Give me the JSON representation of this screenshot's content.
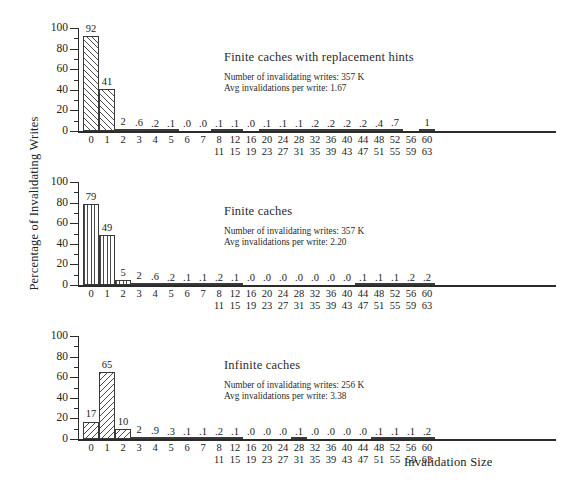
{
  "axis": {
    "y_title": "Percentage of Invalidating Writes",
    "x_title": "Invalidation Size",
    "y_ticks": [
      "0",
      "20",
      "40",
      "60",
      "80",
      "100"
    ],
    "x_tick_labels": [
      {
        "t1": "0",
        "t2": ""
      },
      {
        "t1": "1",
        "t2": ""
      },
      {
        "t1": "2",
        "t2": ""
      },
      {
        "t1": "3",
        "t2": ""
      },
      {
        "t1": "4",
        "t2": ""
      },
      {
        "t1": "5",
        "t2": ""
      },
      {
        "t1": "6",
        "t2": ""
      },
      {
        "t1": "7",
        "t2": ""
      },
      {
        "t1": "8",
        "t2": "11"
      },
      {
        "t1": "12",
        "t2": "15"
      },
      {
        "t1": "16",
        "t2": "19"
      },
      {
        "t1": "20",
        "t2": "23"
      },
      {
        "t1": "24",
        "t2": "27"
      },
      {
        "t1": "28",
        "t2": "31"
      },
      {
        "t1": "32",
        "t2": "35"
      },
      {
        "t1": "36",
        "t2": "39"
      },
      {
        "t1": "40",
        "t2": "43"
      },
      {
        "t1": "44",
        "t2": "47"
      },
      {
        "t1": "48",
        "t2": "51"
      },
      {
        "t1": "52",
        "t2": "55"
      },
      {
        "t1": "56",
        "t2": "59"
      },
      {
        "t1": "60",
        "t2": "63"
      }
    ]
  },
  "panels": [
    {
      "title": "Finite caches with replacement hints",
      "stat_writes": "Number of invalidating writes: 357 K",
      "stat_avg": "Avg invalidations per write: 1.67",
      "hatch": "hatch-a",
      "labels": [
        "92",
        "41",
        "2",
        ".6",
        ".2",
        ".1",
        ".0",
        ".0",
        ".1",
        ".1",
        ".0",
        ".1",
        ".1",
        ".1",
        ".2",
        ".2",
        ".2",
        ".2",
        ".4",
        ".7",
        "",
        "1"
      ],
      "values": [
        92,
        41,
        2,
        0.6,
        0.2,
        0.1,
        0.0,
        0.0,
        0.1,
        0.1,
        0.0,
        0.1,
        0.1,
        0.1,
        0.2,
        0.2,
        0.2,
        0.2,
        0.4,
        0.7,
        0,
        1
      ]
    },
    {
      "title": "Finite caches",
      "stat_writes": "Number of invalidating writes: 357 K",
      "stat_avg": "Avg invalidations per write: 2.20",
      "hatch": "hatch-b",
      "labels": [
        "79",
        "49",
        "5",
        "2",
        ".6",
        ".2",
        ".1",
        ".1",
        ".2",
        ".1",
        ".0",
        ".0",
        ".0",
        ".0",
        ".0",
        ".0",
        ".0",
        ".1",
        ".1",
        ".1",
        ".2",
        ".2",
        "3"
      ],
      "values": [
        79,
        49,
        5,
        2,
        0.6,
        0.2,
        0.1,
        0.1,
        0.2,
        0.1,
        0.0,
        0.0,
        0.0,
        0.0,
        0.0,
        0.0,
        0.0,
        0.1,
        0.1,
        0.1,
        0.2,
        0.2,
        3
      ]
    },
    {
      "title": "Infinite caches",
      "stat_writes": "Number of invalidating writes: 256 K",
      "stat_avg": "Avg invalidations per write: 3.38",
      "hatch": "hatch-c",
      "labels": [
        "17",
        "65",
        "10",
        "2",
        ".9",
        ".3",
        ".1",
        ".1",
        ".2",
        ".1",
        ".0",
        ".0",
        ".0",
        ".1",
        ".0",
        ".0",
        ".0",
        ".0",
        ".1",
        ".1",
        ".1",
        ".2",
        ".2",
        "3"
      ],
      "values": [
        17,
        65,
        10,
        2,
        0.9,
        0.3,
        0.1,
        0.1,
        0.2,
        0.1,
        0.0,
        0.0,
        0.0,
        0.1,
        0.0,
        0.0,
        0.0,
        0.0,
        0.1,
        0.1,
        0.1,
        0.2,
        0.2,
        3
      ]
    }
  ],
  "chart_data": {
    "type": "bar",
    "xlabel": "Invalidation Size",
    "ylabel": "Percentage of Invalidating Writes",
    "ylim": [
      0,
      100
    ],
    "grid": false,
    "legend": "none",
    "categories": [
      "0",
      "1",
      "2",
      "3",
      "4",
      "5",
      "6",
      "7",
      "8-11",
      "12-15",
      "16-19",
      "20-23",
      "24-27",
      "28-31",
      "32-35",
      "36-39",
      "40-43",
      "44-47",
      "48-51",
      "52-55",
      "56-59",
      "60-63"
    ],
    "series": [
      {
        "name": "Finite caches with replacement hints",
        "annotations": {
          "Number of invalidating writes": "357 K",
          "Avg invalidations per write": 1.67
        },
        "values": [
          92,
          41,
          2,
          0.6,
          0.2,
          0.1,
          0.0,
          0.0,
          0.1,
          0.1,
          0.0,
          0.1,
          0.1,
          0.1,
          0.2,
          0.2,
          0.2,
          0.2,
          0.4,
          0.7,
          null,
          1
        ]
      },
      {
        "name": "Finite caches",
        "annotations": {
          "Number of invalidating writes": "357 K",
          "Avg invalidations per write": 2.2
        },
        "values": [
          79,
          49,
          5,
          2,
          0.6,
          0.2,
          0.1,
          0.1,
          0.2,
          0.1,
          0.0,
          0.0,
          0.0,
          0.0,
          0.0,
          0.0,
          0.1,
          0.1,
          0.1,
          0.2,
          0.2,
          3
        ]
      },
      {
        "name": "Infinite caches",
        "annotations": {
          "Number of invalidating writes": "256 K",
          "Avg invalidations per write": 3.38
        },
        "values": [
          17,
          65,
          10,
          2,
          0.9,
          0.3,
          0.1,
          0.1,
          0.2,
          0.1,
          0.0,
          0.0,
          0.1,
          0.0,
          0.0,
          0.0,
          0.0,
          0.1,
          0.1,
          0.1,
          0.2,
          0.2
        ]
      }
    ]
  }
}
